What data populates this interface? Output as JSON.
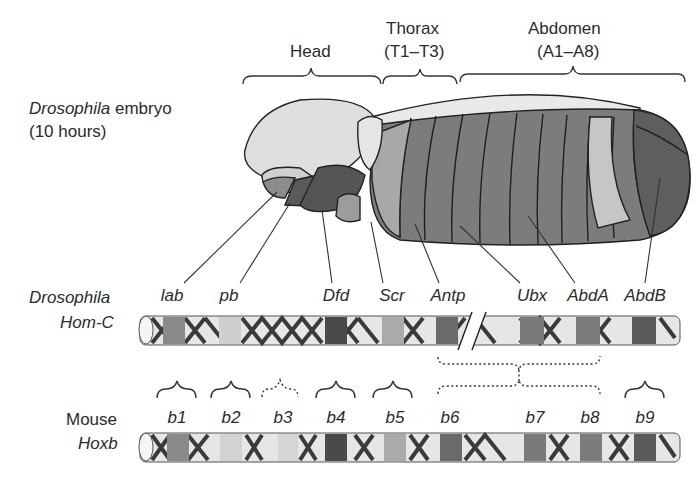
{
  "embryo": {
    "species_label": "Drosophila",
    "suffix_label": "embryo",
    "age_label": "(10 hours)",
    "regions": [
      {
        "name": "Head",
        "sub": ""
      },
      {
        "name": "Thorax",
        "sub": "(T1–T3)"
      },
      {
        "name": "Abdomen",
        "sub": "(A1–A8)"
      }
    ]
  },
  "drosophila_row": {
    "label_line1": "Drosophila",
    "label_line2": "Hom-C",
    "genes": [
      "lab",
      "pb",
      "Dfd",
      "Scr",
      "Antp",
      "Ubx",
      "AbdA",
      "AbdB"
    ]
  },
  "mouse_row": {
    "label_line1": "Mouse",
    "label_line2": "Hoxb",
    "genes": [
      "b1",
      "b2",
      "b3",
      "b4",
      "b5",
      "b6",
      "b7",
      "b8",
      "b9"
    ]
  },
  "colors": {
    "lab": "#8a8a8a",
    "pb": "#cfcfcf",
    "Dfd": "#4a4a4a",
    "Scr": "#aaaaaa",
    "Antp": "#6a6a6a",
    "Ubx": "#7a7a7a",
    "AbdA": "#7c7c7c",
    "AbdB": "#5a5a5a",
    "helix": "#3a3a3a",
    "tube": "#e6e6e6"
  }
}
